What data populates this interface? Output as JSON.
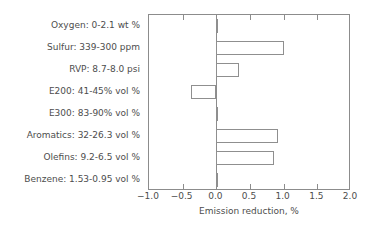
{
  "chart_data": {
    "type": "bar",
    "orientation": "horizontal",
    "title": "",
    "subtitle": "",
    "xlabel": "Emission reduction, %",
    "ylabel": "",
    "xlim": [
      -1.0,
      2.0
    ],
    "xticks": [
      -1.0,
      -0.5,
      0.0,
      0.5,
      1.0,
      1.5,
      2.0
    ],
    "xticklabels": [
      "-1.0",
      "-0.5",
      "0.0",
      "0.5",
      "1.0",
      "1.5",
      "2.0"
    ],
    "grid": false,
    "legend": null,
    "bar_style": {
      "facecolor": "#ffffff",
      "edgecolor": "#8f8f8f"
    },
    "categories": [
      "Oxygen: 0-2.1 wt %",
      "Sulfur: 339-300 ppm",
      "RVP: 8.7-8.0 psi",
      "E200: 41-45% vol %",
      "E300: 83-90% vol %",
      "Aromatics: 32-26.3 vol %",
      "Olefins: 9.2-6.5 vol %",
      "Benzene: 1.53-0.95 vol %"
    ],
    "values": [
      0.03,
      1.01,
      0.34,
      -0.37,
      0.03,
      0.91,
      0.85,
      0.0
    ]
  }
}
